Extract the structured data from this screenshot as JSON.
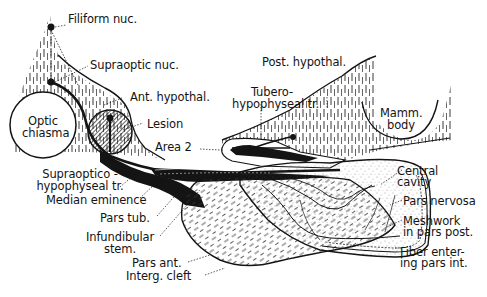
{
  "figure": {
    "type": "anatomical line drawing",
    "colors": {
      "ink": "#141414",
      "background": "#ffffff",
      "caption_faint": "#bbbbbb"
    }
  },
  "labels": {
    "filiform_nuc": "Filiform nuc.",
    "supraoptic_nuc": "Supraoptic nuc.",
    "optic_chiasma_1": "Optic",
    "optic_chiasma_2": "chiasma",
    "ant_hypothal": "Ant. hypothal.",
    "lesion": "Lesion",
    "area_2": "Area 2",
    "post_hypothal": "Post. hypothal.",
    "tubero_1": "Tubero-",
    "tubero_2": "hypophyseal tr.",
    "mamm_body_1": "Mamm.",
    "mamm_body_2": "body",
    "supraoptico_1": "Supraoptico -",
    "supraoptico_2": "hypophyseal tr.",
    "median_eminence": "Median eminence",
    "pars_tub": "Pars tub.",
    "infundibular_1": "Infundibular",
    "infundibular_2": "stem.",
    "pars_ant": "Pars ant.",
    "interg_cleft": "Interg. cleft",
    "central_cavity_1": "Central",
    "central_cavity_2": "cavity",
    "pars_nervosa": "Pars nervosa",
    "meshwork_1": "Meshwork",
    "meshwork_2": "in pars post.",
    "fiber_1": "Fiber enter-",
    "fiber_2": "ing pars int."
  },
  "caption": {
    "text": "..."
  }
}
